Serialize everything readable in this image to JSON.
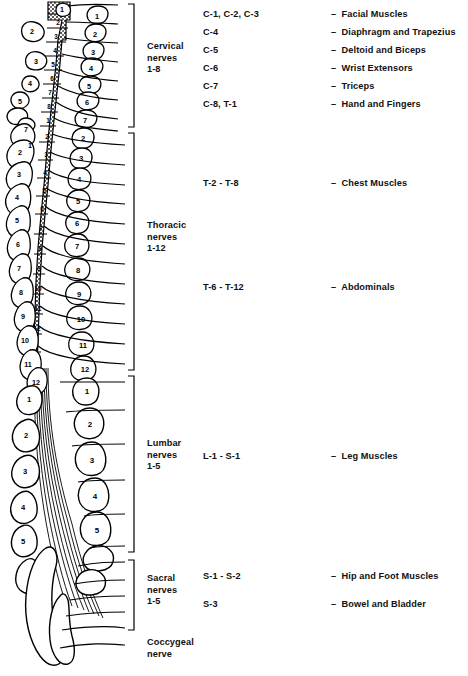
{
  "figure": {
    "background": "#ffffff",
    "ink": "#000000"
  },
  "regions": [
    {
      "id": "cervical",
      "label_lines": [
        "Cervical",
        "nerves",
        "1-8"
      ],
      "label_x": 147,
      "label_y": 46,
      "bracket": {
        "x": 128,
        "top": 4,
        "bottom": 127
      },
      "nerve_count": 8,
      "vertebra_numbers_right": [
        "1",
        "2",
        "3",
        "4",
        "5",
        "6",
        "7"
      ],
      "cord_segment_numbers": [
        "1",
        "2",
        "3",
        "4",
        "5",
        "6",
        "7",
        "8"
      ],
      "rows": [
        {
          "levels": "C-1, C-2, C-3",
          "dash": "–",
          "muscles": "Facial Muscles",
          "y": 28
        },
        {
          "levels": "C-4",
          "dash": "–",
          "muscles": "Diaphragm and Trapezius",
          "y": 46
        },
        {
          "levels": "C-5",
          "dash": "–",
          "muscles": "Deltoid and Biceps",
          "y": 64
        },
        {
          "levels": "C-6",
          "dash": "–",
          "muscles": "Wrist Extensors",
          "y": 82
        },
        {
          "levels": "C-7",
          "dash": "–",
          "muscles": "Triceps",
          "y": 100
        },
        {
          "levels": "C-8, T-1",
          "dash": "–",
          "muscles": "Hand and Fingers",
          "y": 118
        }
      ]
    },
    {
      "id": "thoracic",
      "label_lines": [
        "Thoracic",
        "nerves",
        "1-12"
      ],
      "label_x": 147,
      "label_y": 225,
      "bracket": {
        "x": 128,
        "top": 133,
        "bottom": 370
      },
      "nerve_count": 12,
      "vertebra_numbers_right": [
        "1",
        "2",
        "3",
        "4",
        "5",
        "6",
        "7",
        "8",
        "9",
        "10",
        "11",
        "12"
      ],
      "cord_segment_numbers": [
        "1",
        "2",
        "3",
        "4",
        "5",
        "6",
        "7",
        "8",
        "9",
        "10",
        "11",
        "12"
      ],
      "rows": [
        {
          "levels": "T-2 - T-8",
          "dash": "–",
          "muscles": "Chest Muscles",
          "y": 183
        },
        {
          "levels": "T-6 - T-12",
          "dash": "–",
          "muscles": "Abdominals",
          "y": 287
        }
      ]
    },
    {
      "id": "lumbar",
      "label_lines": [
        "Lumbar",
        "nerves",
        "1-5"
      ],
      "label_x": 147,
      "label_y": 443,
      "bracket": {
        "x": 128,
        "top": 376,
        "bottom": 552
      },
      "nerve_count": 5,
      "vertebra_numbers_right": [
        "1",
        "2",
        "3",
        "4",
        "5"
      ],
      "cord_segment_numbers": [],
      "rows": [
        {
          "levels": "L-1 - S-1",
          "dash": "–",
          "muscles": "Leg Muscles",
          "y": 456
        }
      ]
    },
    {
      "id": "sacral",
      "label_lines": [
        "Sacral",
        "nerves",
        "1-5"
      ],
      "label_x": 147,
      "label_y": 578,
      "bracket": {
        "x": 128,
        "top": 560,
        "bottom": 630
      },
      "nerve_count": 5,
      "vertebra_numbers_right": [],
      "cord_segment_numbers": [],
      "rows": [
        {
          "levels": "S-1 - S-2",
          "dash": "–",
          "muscles": "Hip and Foot Muscles",
          "y": 576
        },
        {
          "levels": "S-3",
          "dash": "–",
          "muscles": "Bowel and Bladder",
          "y": 604
        }
      ]
    },
    {
      "id": "coccygeal",
      "label_lines": [
        "Coccygeal",
        "nerve"
      ],
      "label_x": 147,
      "label_y": 641,
      "bracket": null,
      "nerve_count": 1,
      "vertebra_numbers_right": [],
      "cord_segment_numbers": [],
      "rows": []
    }
  ],
  "anatomy": {
    "cervical_left_processes": [
      "1",
      "2",
      "3",
      "4",
      "5"
    ],
    "thoracic_left_processes": [
      "2",
      "3",
      "4",
      "5",
      "6",
      "7",
      "8",
      "9",
      "10",
      "11",
      "12"
    ],
    "lumbar_left_processes": [
      "1",
      "2",
      "3",
      "4",
      "5"
    ],
    "cord_shading": "stipple",
    "cauda_equina_label": "descending nerve fibers"
  }
}
